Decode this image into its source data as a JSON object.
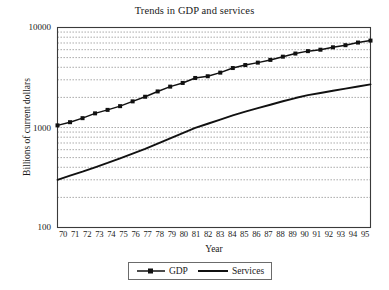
{
  "chart_data": {
    "type": "line",
    "title": "Trends in GDP and services",
    "xlabel": "Year",
    "ylabel": "Billions of current dollars",
    "yscale": "log",
    "ylim": [
      100,
      10000
    ],
    "ytick_labels": [
      "10000",
      "1000",
      "100"
    ],
    "ytick_values": [
      10000,
      1000,
      100
    ],
    "grid": "horizontal-dotted-minor",
    "legend_position": "below-center",
    "categories": [
      "70",
      "71",
      "72",
      "73",
      "74",
      "75",
      "76",
      "77",
      "78",
      "79",
      "80",
      "81",
      "82",
      "83",
      "84",
      "85",
      "86",
      "87",
      "88",
      "89",
      "90",
      "91",
      "92",
      "93",
      "94",
      "95"
    ],
    "x": [
      70,
      71,
      72,
      73,
      74,
      75,
      76,
      77,
      78,
      79,
      80,
      81,
      82,
      83,
      84,
      85,
      86,
      87,
      88,
      89,
      90,
      91,
      92,
      93,
      94,
      95
    ],
    "series": [
      {
        "name": "GDP",
        "marker": "square",
        "values": [
          1050,
          1130,
          1240,
          1385,
          1500,
          1635,
          1825,
          2030,
          2294,
          2563,
          2790,
          3128,
          3255,
          3537,
          3933,
          4213,
          4453,
          4742,
          5108,
          5489,
          5803,
          5996,
          6338,
          6657,
          7072,
          7398
        ]
      },
      {
        "name": "Services",
        "marker": "none",
        "values": [
          300,
          330,
          362,
          400,
          442,
          492,
          548,
          612,
          690,
          780,
          880,
          990,
          1090,
          1200,
          1320,
          1440,
          1560,
          1690,
          1830,
          1970,
          2105,
          2215,
          2330,
          2450,
          2570,
          2700
        ]
      }
    ]
  },
  "legend": {
    "entries": [
      {
        "label": "GDP"
      },
      {
        "label": "Services"
      }
    ]
  }
}
